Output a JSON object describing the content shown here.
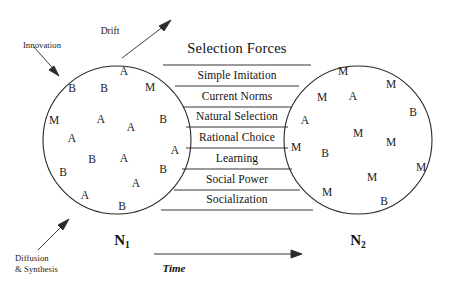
{
  "figure": {
    "title": "Selection Forces",
    "time_axis_label": "Time",
    "left_population_label": "N",
    "left_population_sub": "1",
    "right_population_label": "N",
    "right_population_sub": "2",
    "annotations": {
      "innovation": "Innovation",
      "drift": "Drift",
      "diffusion": "Diffusion\n& Synthesis"
    },
    "selection_forces": [
      "Simple Imitation",
      "Current Norms",
      "Natural Selection",
      "Rational Choice",
      "Learning",
      "Social Power",
      "Socialization"
    ],
    "left_circle_agents": [
      {
        "label": "A",
        "x": 124,
        "y": 72
      },
      {
        "label": "B",
        "x": 72,
        "y": 89
      },
      {
        "label": "B",
        "x": 104,
        "y": 89
      },
      {
        "label": "M",
        "x": 150,
        "y": 88
      },
      {
        "label": "M",
        "x": 54,
        "y": 121
      },
      {
        "label": "A",
        "x": 101,
        "y": 120
      },
      {
        "label": "A",
        "x": 131,
        "y": 128
      },
      {
        "label": "B",
        "x": 163,
        "y": 120
      },
      {
        "label": "A",
        "x": 72,
        "y": 139
      },
      {
        "label": "B",
        "x": 92,
        "y": 160
      },
      {
        "label": "A",
        "x": 124,
        "y": 159
      },
      {
        "label": "A",
        "x": 175,
        "y": 151
      },
      {
        "label": "B",
        "x": 63,
        "y": 173
      },
      {
        "label": "B",
        "x": 163,
        "y": 170
      },
      {
        "label": "A",
        "x": 85,
        "y": 196
      },
      {
        "label": "A",
        "x": 136,
        "y": 184
      },
      {
        "label": "B",
        "x": 122,
        "y": 207
      }
    ],
    "right_circle_agents": [
      {
        "label": "M",
        "x": 343,
        "y": 72
      },
      {
        "label": "M",
        "x": 391,
        "y": 85
      },
      {
        "label": "M",
        "x": 322,
        "y": 98
      },
      {
        "label": "A",
        "x": 353,
        "y": 97
      },
      {
        "label": "B",
        "x": 413,
        "y": 113
      },
      {
        "label": "A",
        "x": 305,
        "y": 121
      },
      {
        "label": "M",
        "x": 358,
        "y": 134
      },
      {
        "label": "M",
        "x": 391,
        "y": 143
      },
      {
        "label": "M",
        "x": 296,
        "y": 148
      },
      {
        "label": "B",
        "x": 325,
        "y": 154
      },
      {
        "label": "M",
        "x": 421,
        "y": 168
      },
      {
        "label": "M",
        "x": 372,
        "y": 178
      },
      {
        "label": "M",
        "x": 327,
        "y": 193
      },
      {
        "label": "B",
        "x": 384,
        "y": 202
      }
    ]
  }
}
